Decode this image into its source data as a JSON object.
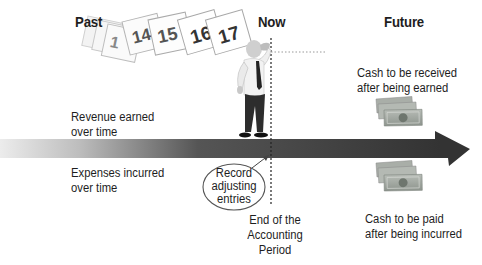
{
  "headings": {
    "past": "Past",
    "now": "Now",
    "future": "Future"
  },
  "calendar_pages": [
    "1",
    "14",
    "15",
    "16",
    "17"
  ],
  "timeline": {
    "revenue_label_line1": "Revenue earned",
    "revenue_label_line2": "over time",
    "expenses_label_line1": "Expenses incurred",
    "expenses_label_line2": "over time"
  },
  "callout": {
    "line1": "Record",
    "line2": "adjusting",
    "line3": "entries"
  },
  "period_end": {
    "line1": "End of the",
    "line2": "Accounting",
    "line3": "Period"
  },
  "future_items": {
    "received_line1": "Cash to be received",
    "received_line2": "after being earned",
    "paid_line1": "Cash to be paid",
    "paid_line2": "after being incurred"
  },
  "icons": [
    "calendar-pages-icon",
    "businessman-figure-icon",
    "cash-bills-icon",
    "timeline-arrow-icon"
  ],
  "colors": {
    "arrow_dark": "#3c3c3c",
    "arrow_light": "#e6e6e6",
    "cash_green": "#9aa19a",
    "text": "#1e1e1e"
  }
}
